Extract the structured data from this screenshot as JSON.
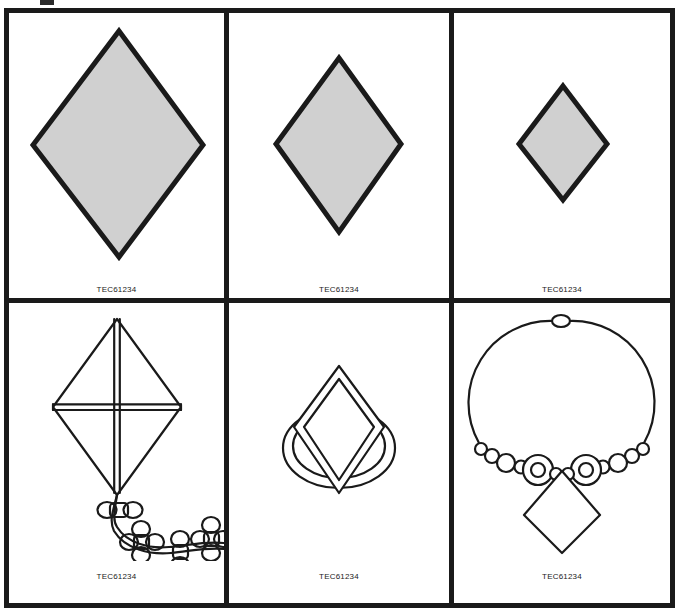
{
  "sheet": {
    "title": "Design patent figure sheet",
    "background_color": "#ffffff",
    "frame_color": "#1a1a1a",
    "shape_fill_color": "#d0d0d0",
    "shape_stroke_color": "#1a1a1a",
    "line_color": "#1a1a1a"
  },
  "panels": [
    {
      "id": "panel-1",
      "row": 1,
      "column": 1,
      "subject": "large-filled-diamond",
      "description": "Large shaded diamond / rhombus",
      "label": "TEC61234"
    },
    {
      "id": "panel-2",
      "row": 1,
      "column": 2,
      "subject": "medium-filled-diamond",
      "description": "Medium shaded diamond / rhombus",
      "label": "TEC61234"
    },
    {
      "id": "panel-3",
      "row": 1,
      "column": 3,
      "subject": "small-filled-diamond",
      "description": "Small shaded diamond / rhombus",
      "label": "TEC61234"
    },
    {
      "id": "panel-4",
      "row": 2,
      "column": 1,
      "subject": "kite-with-bow-tail",
      "description": "Diamond kite with cross spars and bow-knot tail",
      "label": "TEC61234"
    },
    {
      "id": "panel-5",
      "row": 2,
      "column": 2,
      "subject": "ring-with-diamond-stone",
      "description": "Finger ring band with diamond-shaped gemstone",
      "label": "TEC61234"
    },
    {
      "id": "panel-6",
      "row": 2,
      "column": 3,
      "subject": "beaded-necklace-with-diamond-pendant",
      "description": "Beaded necklace with clasp and diamond pendant",
      "label": "TEC61234"
    }
  ]
}
